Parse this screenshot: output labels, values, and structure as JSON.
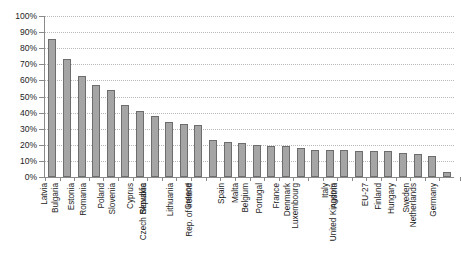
{
  "chart_data": {
    "type": "bar",
    "title": "",
    "subtitle": "",
    "xlabel": "",
    "ylabel": "",
    "ylim": [
      0,
      100
    ],
    "y_tick_labels": [
      "0%",
      "10%",
      "20%",
      "30%",
      "40%",
      "50%",
      "60%",
      "70%",
      "80%",
      "90%",
      "100%"
    ],
    "y_tick_values": [
      0,
      10,
      20,
      30,
      40,
      50,
      60,
      70,
      80,
      90,
      100
    ],
    "grid": true,
    "legend": false,
    "legend_position": "none",
    "orientation": "vertical",
    "bar_color": "#a5a5a5",
    "bar_edge_color": "#6d6d6d",
    "categories": [
      "Latvia",
      "Bulgaria",
      "Estonia",
      "Romania",
      "Poland",
      "Slovenia",
      "Cyprus",
      "Slovakia",
      "Czech Republic",
      "Lithuania",
      "Greece",
      "Rep. of Ireland",
      "Spain",
      "Malta",
      "Belgium",
      "Portugal",
      "France",
      "Denmark",
      "Luxembourg",
      "Italy",
      "Austria",
      "United Kingdom",
      "EU-27",
      "Finland",
      "Hungary",
      "Sweden",
      "Netherlands",
      "Germany"
    ],
    "values": [
      86,
      73,
      63,
      57,
      54,
      45,
      41,
      38,
      34,
      33,
      32,
      23,
      22,
      21,
      20,
      19,
      19,
      18,
      17,
      17,
      17,
      16,
      16,
      16,
      15,
      14,
      13,
      3
    ]
  },
  "chart": {
    "axis_color": "#8a8a8a",
    "grid_color": "#b9b9b9"
  }
}
